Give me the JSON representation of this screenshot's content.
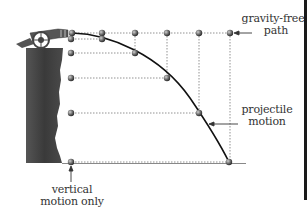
{
  "diagram": {
    "labels": {
      "gravity_free": [
        "gravity-free",
        "path"
      ],
      "projectile": [
        "projectile",
        "motion"
      ],
      "vertical": [
        "vertical",
        "motion only"
      ]
    },
    "elements": {
      "cannon": "cannon-icon",
      "cliff": "cliff",
      "ground": "ground-line"
    },
    "points": {
      "gravity_free_path": [
        [
          72,
          33
        ],
        [
          102,
          33
        ],
        [
          135,
          33
        ],
        [
          167,
          33
        ],
        [
          199,
          33
        ],
        [
          230,
          33
        ]
      ],
      "vertical_motion": [
        [
          71,
          33
        ],
        [
          71,
          39
        ],
        [
          71,
          53
        ],
        [
          71,
          78
        ],
        [
          71,
          113
        ],
        [
          71,
          162
        ]
      ],
      "projectile_motion": [
        [
          72,
          33
        ],
        [
          102,
          39
        ],
        [
          135,
          53
        ],
        [
          167,
          78
        ],
        [
          199,
          113
        ],
        [
          229,
          162
        ]
      ]
    },
    "colors": {
      "ball": "#6a6a6a",
      "cliff": "#3f3f3f",
      "curve": "#111111",
      "guide": "#777777",
      "text": "#333333"
    }
  }
}
